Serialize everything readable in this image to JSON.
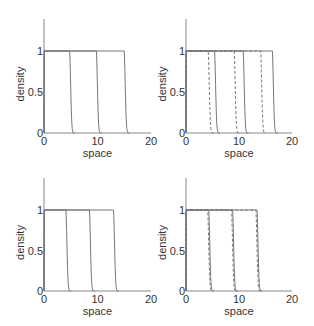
{
  "chart_data": [
    {
      "type": "line",
      "panel": "top-left",
      "xlabel": "space",
      "ylabel": "density",
      "xlim": [
        0,
        20
      ],
      "ylim": [
        0,
        1.4
      ],
      "xticks": [
        "0",
        "10",
        "20"
      ],
      "yticks": [
        "0",
        "0.5",
        "1"
      ],
      "grid": false,
      "series": [
        {
          "name": "solid front t1",
          "style": "solid",
          "front": 4.8
        },
        {
          "name": "solid front t2",
          "style": "solid",
          "front": 9.8
        },
        {
          "name": "solid front t3",
          "style": "solid",
          "front": 15.0
        }
      ]
    },
    {
      "type": "line",
      "panel": "top-right",
      "xlabel": "space",
      "ylabel": "density",
      "xlim": [
        0,
        20
      ],
      "ylim": [
        0,
        1.4
      ],
      "xticks": [
        "0",
        "10",
        "20"
      ],
      "yticks": [
        "0",
        "0.5",
        "1"
      ],
      "grid": false,
      "series": [
        {
          "name": "dashed front t1",
          "style": "dashed",
          "front": 4.2
        },
        {
          "name": "dashed front t2",
          "style": "dashed",
          "front": 9.1
        },
        {
          "name": "dashed front t3",
          "style": "dashed",
          "front": 14.1
        },
        {
          "name": "solid front t1",
          "style": "solid",
          "front": 5.4
        },
        {
          "name": "solid front t2",
          "style": "solid",
          "front": 10.8
        },
        {
          "name": "solid front t3",
          "style": "solid",
          "front": 16.3
        }
      ]
    },
    {
      "type": "line",
      "panel": "bottom-left",
      "xlabel": "space",
      "ylabel": "density",
      "xlim": [
        0,
        20
      ],
      "ylim": [
        0,
        1.4
      ],
      "xticks": [
        "0",
        "10",
        "20"
      ],
      "yticks": [
        "0",
        "0.5",
        "1"
      ],
      "grid": false,
      "series": [
        {
          "name": "solid front t1",
          "style": "solid",
          "front": 4.1
        },
        {
          "name": "solid front t2",
          "style": "solid",
          "front": 8.5
        },
        {
          "name": "solid front t3",
          "style": "solid",
          "front": 13.0
        }
      ]
    },
    {
      "type": "line",
      "panel": "bottom-right",
      "xlabel": "space",
      "ylabel": "density",
      "xlim": [
        0,
        20
      ],
      "ylim": [
        0,
        1.4
      ],
      "xticks": [
        "0",
        "10",
        "20"
      ],
      "yticks": [
        "0",
        "0.5",
        "1"
      ],
      "grid": false,
      "series": [
        {
          "name": "dashed front t1",
          "style": "dashed",
          "front": 4.1
        },
        {
          "name": "dashed front t2",
          "style": "dashed",
          "front": 8.6
        },
        {
          "name": "dashed front t3",
          "style": "dashed",
          "front": 13.2
        },
        {
          "name": "solid front t1",
          "style": "solid",
          "front": 4.3
        },
        {
          "name": "solid front t2",
          "style": "solid",
          "front": 8.8
        },
        {
          "name": "solid front t3",
          "style": "solid",
          "front": 13.4
        }
      ]
    }
  ],
  "labels": {
    "xlabel": "space",
    "ylabel": "density",
    "xtick_0": "0",
    "xtick_10": "10",
    "xtick_20": "20",
    "ytick_0": "0",
    "ytick_05": "0.5",
    "ytick_1": "1"
  },
  "colors": {
    "solid": "#777777",
    "dashed": "#777777",
    "axis": "#888888"
  }
}
